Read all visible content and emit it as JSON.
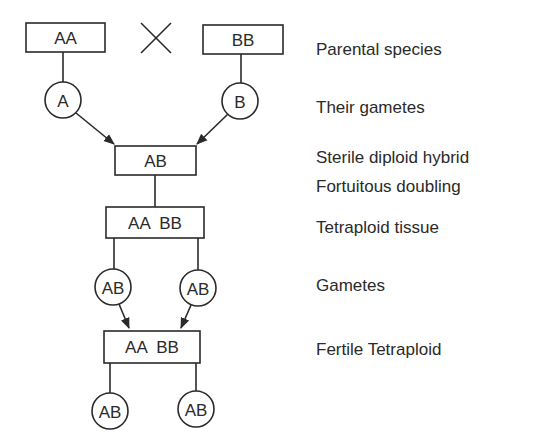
{
  "diagram": {
    "cross_symbol": "×",
    "parents": {
      "left": "AA",
      "right": "BB"
    },
    "parent_gametes": {
      "left": "A",
      "right": "B"
    },
    "hybrid": "AB",
    "tetraploid_tissue": "AA  BB",
    "tetraploid_gametes": {
      "left": "AB",
      "right": "AB"
    },
    "fertile_tetraploid": "AA  BB",
    "offspring_gametes": {
      "left": "AB",
      "right": "AB"
    },
    "colors": {
      "ink": "#2a2a2a",
      "background": "#ffffff"
    }
  },
  "labels": {
    "parental_species": "Parental species",
    "their_gametes": "Their gametes",
    "sterile_hybrid": "Sterile diploid hybrid",
    "fortuitous_doubling": "Fortuitous doubling",
    "tetraploid_tissue": "Tetraploid tissue",
    "gametes": "Gametes",
    "fertile_tetraploid": "Fertile Tetraploid"
  }
}
